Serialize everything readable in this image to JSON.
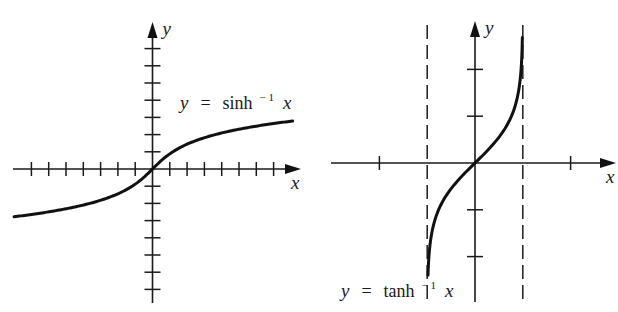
{
  "chart_data": [
    {
      "type": "line",
      "title": "",
      "function": "asinh",
      "label": "y = sinh⁻¹ x",
      "label_parts": {
        "lhs": "y",
        "eq": "=",
        "fn": "sinh",
        "sup": "− 1",
        "arg": "x"
      },
      "xlabel": "x",
      "ylabel": "y",
      "xlim": [
        -8,
        8
      ],
      "ylim": [
        -8,
        8
      ],
      "x_ticks": [
        -7,
        -6,
        -5,
        -4,
        -3,
        -2,
        -1,
        1,
        2,
        3,
        4,
        5,
        6,
        7
      ],
      "y_ticks": [
        -7,
        -6,
        -5,
        -4,
        -3,
        -2,
        -1,
        1,
        2,
        3,
        4,
        5,
        6,
        7
      ],
      "tick_labels_shown": false,
      "grid": false,
      "curve_domain": [
        -8,
        8.1
      ],
      "sample_points": [
        {
          "x": -8,
          "y": -2.78
        },
        {
          "x": -4,
          "y": -2.09
        },
        {
          "x": -2,
          "y": -1.44
        },
        {
          "x": -1,
          "y": -0.88
        },
        {
          "x": 0,
          "y": 0
        },
        {
          "x": 1,
          "y": 0.88
        },
        {
          "x": 2,
          "y": 1.44
        },
        {
          "x": 4,
          "y": 2.09
        },
        {
          "x": 8,
          "y": 2.78
        }
      ],
      "layout": {
        "origin_px": [
          152.5,
          169
        ],
        "unit_px_x": 17.3,
        "unit_px_y": 17.2,
        "x_axis_px": [
          13,
          301
        ],
        "y_axis_px": [
          22,
          303
        ],
        "label_px": [
          180,
          109
        ]
      }
    },
    {
      "type": "line",
      "title": "",
      "function": "atanh",
      "label": "y = tanh⁻¹ x",
      "label_parts": {
        "lhs": "y",
        "eq": "=",
        "fn": "tanh",
        "sup": "− 1",
        "arg": "x"
      },
      "xlabel": "x",
      "ylabel": "y",
      "xlim": [
        -3,
        3
      ],
      "ylim": [
        -3,
        3
      ],
      "x_ticks": [
        -2,
        2
      ],
      "y_ticks": [
        -2,
        -1,
        1,
        2
      ],
      "tick_labels_shown": false,
      "grid": false,
      "asymptotes": [
        -1,
        1
      ],
      "asymptote_style": "dashed",
      "curve_range_y": [
        -2.4,
        2.68
      ],
      "sample_points": [
        {
          "x": -0.984,
          "y": -2.4
        },
        {
          "x": -0.9,
          "y": -1.47
        },
        {
          "x": -0.5,
          "y": -0.55
        },
        {
          "x": 0,
          "y": 0
        },
        {
          "x": 0.5,
          "y": 0.55
        },
        {
          "x": 0.9,
          "y": 1.47
        },
        {
          "x": 0.991,
          "y": 2.68
        }
      ],
      "layout": {
        "origin_px": [
          475,
          163
        ],
        "unit_px_x": 47.8,
        "unit_px_y": 46.8,
        "x_axis_px": [
          331,
          616
        ],
        "y_axis_px": [
          21,
          302
        ],
        "asym_px_y": [
          25,
          302
        ],
        "label_px": [
          341,
          297
        ]
      }
    }
  ]
}
